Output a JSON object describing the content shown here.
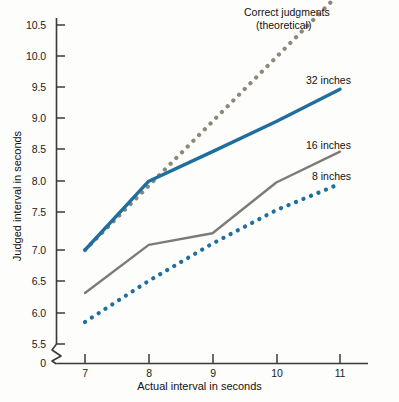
{
  "chart_data": {
    "type": "line",
    "title": "",
    "xlabel": "Actual interval in seconds",
    "ylabel": "Judged interval in seconds",
    "x": [
      7,
      8,
      9,
      10,
      11
    ],
    "xticks": [
      "7",
      "8",
      "9",
      "10",
      "11"
    ],
    "yticks": [
      "0",
      "5.5",
      "6.0",
      "6.5",
      "7.0",
      "7.5",
      "8.0",
      "8.5",
      "9.0",
      "9.5",
      "10.0",
      "10.5"
    ],
    "xlim": [
      7,
      11
    ],
    "ylim": [
      5.5,
      10.5
    ],
    "axis_break": true,
    "grid": false,
    "legend_position": "inline-right-of-line-ends",
    "series": [
      {
        "name": "Correct judgments (theoretical)",
        "style": "dotted",
        "color": "#8d887b",
        "values": [
          7.0,
          8.0,
          9.0,
          10.0,
          11.0
        ]
      },
      {
        "name": "32 inches",
        "style": "solid",
        "color": "#1f6f9e",
        "values": [
          7.0,
          8.07,
          8.53,
          9.0,
          9.5
        ]
      },
      {
        "name": "16 inches",
        "style": "solid",
        "color": "#7b7b79",
        "values": [
          6.33,
          7.08,
          7.26,
          8.05,
          8.53
        ]
      },
      {
        "name": "8 inches",
        "style": "dotted",
        "color": "#1f6f9e",
        "values": [
          5.88,
          6.52,
          7.1,
          7.62,
          8.03
        ]
      }
    ]
  },
  "labels": {
    "correct_line1": "Correct judgments",
    "correct_line2": "(theoretical)",
    "series_32": "32 inches",
    "series_16": "16 inches",
    "series_8": "8 inches",
    "y_axis_title": "Judged interval in seconds",
    "x_axis_title": "Actual interval in seconds"
  },
  "yaxis": {
    "labels": [
      "10.5",
      "10.0",
      "9.5",
      "9.0",
      "8.5",
      "8.0",
      "7.5",
      "7.0",
      "6.5",
      "6.0",
      "5.5",
      "0"
    ]
  },
  "xaxis": {
    "labels": [
      "7",
      "8",
      "9",
      "10",
      "11"
    ]
  },
  "colors": {
    "blue": "#1f6f9e",
    "gray_line": "#7b7b79",
    "gray_dot": "#8d887b",
    "axis": "#3a3a38",
    "background": "#fdfdfc"
  }
}
